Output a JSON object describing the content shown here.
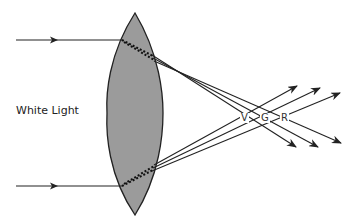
{
  "diagram": {
    "input_label": "White Light",
    "color_labels": {
      "violet": "V",
      "green": "G",
      "red": "R"
    },
    "colors": {
      "lens_fill": "#9b9b9b",
      "stroke": "#222222",
      "background": "#ffffff"
    },
    "elements": [
      "convex lens",
      "two incoming parallel rays",
      "dispersed rays (V, G, R) crossing at separate focal points"
    ]
  }
}
